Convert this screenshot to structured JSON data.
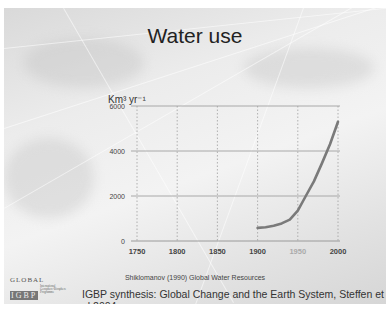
{
  "slide": {
    "title": "Water use",
    "unit_label": "Km³ yr⁻¹",
    "source_note": "Shiklomanov (1990) Global Water Resources",
    "citation": "IGBP synthesis: Global Change and the Earth System, Steffen et al 2004",
    "logo": {
      "line1": "GLOBAL",
      "line2": "IGBP",
      "line3": "CHANGE",
      "subtext": "International Geosphere-Biosphere Programme"
    }
  },
  "chart_data": {
    "type": "line",
    "title": "Water use",
    "xlabel": "",
    "ylabel": "Km³ yr⁻¹",
    "x_ticks": [
      1750,
      1800,
      1850,
      1900,
      1950,
      2000
    ],
    "y_ticks": [
      0,
      2000,
      4000,
      6000
    ],
    "xlim": [
      1750,
      2000
    ],
    "ylim": [
      0,
      6000
    ],
    "grid": {
      "x": "dotted",
      "y": "solid"
    },
    "series": [
      {
        "name": "Water use",
        "color": "#7a7a7a",
        "x": [
          1900,
          1910,
          1920,
          1930,
          1940,
          1950,
          1960,
          1970,
          1980,
          1990,
          2000
        ],
        "y": [
          580,
          610,
          680,
          780,
          950,
          1350,
          2000,
          2650,
          3450,
          4300,
          5300
        ]
      }
    ]
  }
}
